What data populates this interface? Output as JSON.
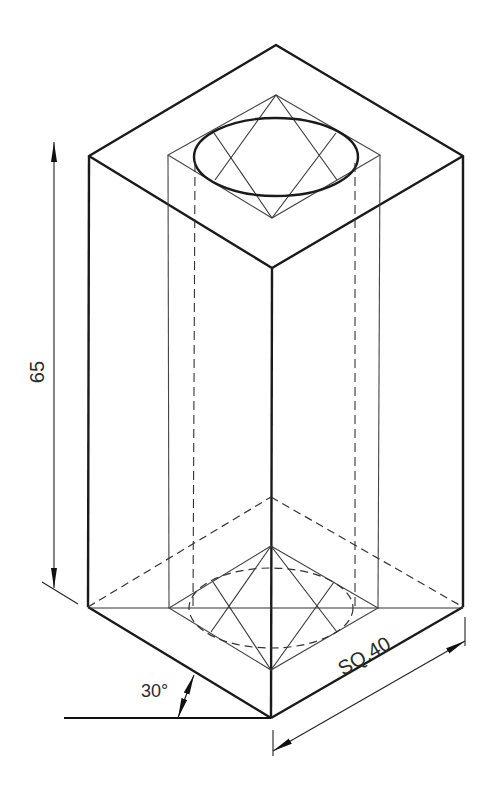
{
  "drawing": {
    "title": "Isometric view of square block with cylindrical hole",
    "dimensions": {
      "height": "65",
      "side": "SQ.40",
      "iso_angle": "30°"
    },
    "colors": {
      "line": "#1a1a1a",
      "thin_line": "#333333",
      "background": "#ffffff"
    }
  }
}
